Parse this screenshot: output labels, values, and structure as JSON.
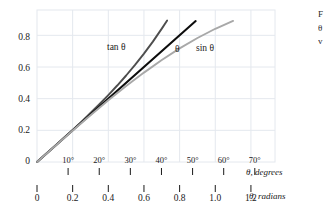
{
  "chart_data": {
    "type": "line",
    "title": "",
    "subtitle": "",
    "xlabel_primary": "θ, radians",
    "xlabel_secondary": "θ, degrees",
    "ylabel": "",
    "xlim": [
      0,
      1.335
    ],
    "ylim": [
      0,
      0.96
    ],
    "grid": true,
    "grid_color": "#e4e8ee",
    "legend_position": "inline-annotations",
    "x_ticks_radians": [
      "0",
      "0.2",
      "0.4",
      "0.6",
      "0.8",
      "1.0",
      "1.2"
    ],
    "x_tick_values_radians": [
      0,
      0.2,
      0.4,
      0.6,
      0.8,
      1.0,
      1.2
    ],
    "x_ticks_degrees": [
      "10°",
      "20°",
      "30°",
      "40°",
      "50°",
      "60°",
      "70°"
    ],
    "x_tick_values_degrees": [
      10,
      20,
      30,
      40,
      50,
      60,
      70
    ],
    "x_tick_degrees_in_radians": [
      0.1745,
      0.3491,
      0.5236,
      0.6981,
      0.8727,
      1.0472,
      1.2217
    ],
    "y_ticks": [
      "0",
      "0.2",
      "0.4",
      "0.6",
      "0.8"
    ],
    "y_tick_values": [
      0,
      0.2,
      0.4,
      0.6,
      0.8
    ],
    "series": [
      {
        "name": "tan θ",
        "label": "tan θ",
        "color": "#4d4d4d",
        "width": 1.9,
        "x": [
          0,
          0.05,
          0.1,
          0.15,
          0.2,
          0.25,
          0.3,
          0.35,
          0.4,
          0.45,
          0.5,
          0.55,
          0.6,
          0.65,
          0.7,
          0.73
        ],
        "y": [
          0,
          0.05,
          0.1003,
          0.1511,
          0.2027,
          0.2553,
          0.3093,
          0.365,
          0.4228,
          0.4831,
          0.5463,
          0.6131,
          0.6841,
          0.7602,
          0.8423,
          0.8935
        ]
      },
      {
        "name": "θ",
        "label": "θ",
        "color": "#0d0d0d",
        "width": 2.1,
        "x": [
          0,
          0.89
        ],
        "y": [
          0,
          0.89
        ]
      },
      {
        "name": "sin θ",
        "label": "sin θ",
        "color": "#a8a8a8",
        "width": 1.9,
        "x": [
          0,
          0.1,
          0.2,
          0.3,
          0.4,
          0.5,
          0.6,
          0.7,
          0.8,
          0.9,
          1.0,
          1.1,
          1.1
        ],
        "y": [
          0,
          0.0998,
          0.1987,
          0.2955,
          0.3894,
          0.4794,
          0.5646,
          0.6442,
          0.7174,
          0.7833,
          0.8415,
          0.8912,
          0.8912
        ]
      }
    ],
    "annotations": [
      {
        "text": "tan θ",
        "x_px": 107,
        "y_px": 43
      },
      {
        "text": "θ",
        "x_px": 175,
        "y_px": 45
      },
      {
        "text": "sin θ",
        "x_px": 196,
        "y_px": 44
      }
    ]
  },
  "axes": {
    "degrees_axis_label": "θ, degrees",
    "radians_axis_label": "θ, radians"
  },
  "caption": {
    "line1": "F",
    "line2": "θ",
    "line3": "v"
  }
}
